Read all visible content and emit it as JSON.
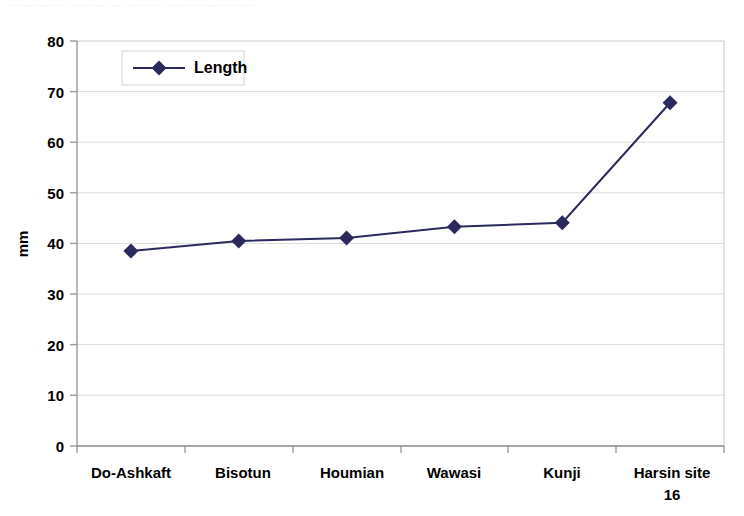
{
  "header_remnant": {
    "text": "·· ············ ··· ······ ···· ···· ······ ·· ·· ········ ·· ······· ·· ······"
  },
  "chart_data": {
    "type": "line",
    "title": "",
    "subtitle": "",
    "xlabel": "",
    "ylabel": "mm",
    "categories": [
      "Do-Ashkaft",
      "Bisotun",
      "Houmian",
      "Wawasi",
      "Kunji",
      "Harsin site 16"
    ],
    "series": [
      {
        "name": "Length",
        "values": [
          38.5,
          40.5,
          41.1,
          43.3,
          44.1,
          67.8
        ],
        "color": "#2a2a5e",
        "marker": "diamond"
      }
    ],
    "ylim": [
      0,
      80
    ],
    "ytick_step": 10,
    "yticks": [
      "0",
      "10",
      "20",
      "30",
      "40",
      "50",
      "60",
      "70",
      "80"
    ],
    "grid": {
      "horizontal": true,
      "vertical": false
    },
    "legend": {
      "position": "top-left",
      "entries": [
        "Length"
      ]
    },
    "plot_background": "#ffffff",
    "grid_color": "#d9d9d9",
    "axis_color": "#808080"
  }
}
